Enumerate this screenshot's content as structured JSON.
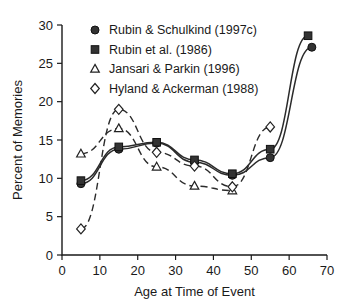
{
  "chart_data": {
    "type": "line",
    "title": "",
    "xlabel": "Age at Time of Event",
    "ylabel": "Percent of Memories",
    "xlim": [
      0,
      70
    ],
    "ylim": [
      0,
      30
    ],
    "xticks": [
      0,
      10,
      20,
      30,
      40,
      50,
      60,
      70
    ],
    "yticks": [
      0,
      5,
      10,
      15,
      20,
      25,
      30
    ],
    "grid": false,
    "legend_position": "top-left",
    "series": [
      {
        "name": "Rubin & Schulkind (1997c)",
        "marker": "filled-circle",
        "linestyle": "solid",
        "x": [
          5,
          15,
          25,
          35,
          45,
          55,
          66
        ],
        "values": [
          9.3,
          13.8,
          14.6,
          12.1,
          10.4,
          12.7,
          27.1
        ]
      },
      {
        "name": "Rubin et al. (1986)",
        "marker": "filled-square",
        "linestyle": "solid",
        "x": [
          5,
          15,
          25,
          35,
          45,
          55,
          65
        ],
        "values": [
          9.7,
          14.1,
          14.7,
          12.4,
          10.6,
          13.8,
          28.6
        ]
      },
      {
        "name": "Jansari & Parkin (1996)",
        "marker": "open-triangle",
        "linestyle": "dashed",
        "x": [
          5,
          15,
          25,
          35,
          45
        ],
        "values": [
          13.2,
          16.5,
          11.5,
          9.0,
          8.4
        ]
      },
      {
        "name": "Hyland & Ackerman (1988)",
        "marker": "open-diamond",
        "linestyle": "dashed",
        "x": [
          5,
          15,
          25,
          35,
          45,
          55
        ],
        "values": [
          3.4,
          19.0,
          13.4,
          11.6,
          8.9,
          16.7
        ]
      }
    ]
  },
  "legend": {
    "items": [
      {
        "label": "Rubin & Schulkind (1997c)",
        "marker": "filled-circle"
      },
      {
        "label": "Rubin et al. (1986)",
        "marker": "filled-square"
      },
      {
        "label": "Jansari & Parkin (1996)",
        "marker": "open-triangle"
      },
      {
        "label": "Hyland & Ackerman (1988)",
        "marker": "open-diamond"
      }
    ]
  },
  "colors": {
    "ink": "#1a1a1a",
    "marker_fill": "#333333",
    "marker_open": "#ffffff",
    "background": "#ffffff"
  }
}
